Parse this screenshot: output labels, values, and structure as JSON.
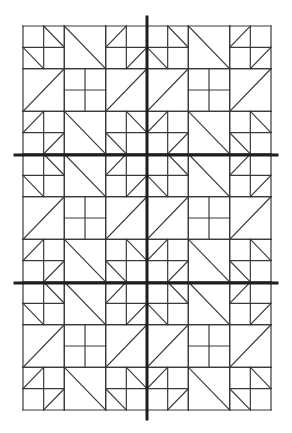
{
  "diagram": {
    "type": "quilt-block-pattern",
    "canvas": {
      "width": 292,
      "height": 433,
      "background": "#ffffff"
    },
    "grid": {
      "left": 23,
      "top": 26,
      "right": 271,
      "bottom": 410,
      "blocks_x": 2,
      "blocks_y": 3,
      "cells_per_block": 6,
      "line_color": "#3a3a3a",
      "line_width": 1.2
    },
    "block": {
      "description": "6x6 cell block: 2x2 units, each unit is a half-square-triangle four-patch, a large diagonal square, or a plain four-patch",
      "units": [
        [
          {
            "kind": "hst4",
            "diagonals": [
              "none",
              "back",
              "back",
              "none"
            ]
          },
          {
            "kind": "big-diagonal",
            "direction": "back"
          },
          {
            "kind": "hst4",
            "diagonals": [
              "fwd",
              "none",
              "none",
              "fwd"
            ]
          }
        ],
        [
          {
            "kind": "big-diagonal",
            "direction": "fwd"
          },
          {
            "kind": "four-patch"
          },
          {
            "kind": "big-diagonal",
            "direction": "fwd"
          }
        ],
        [
          {
            "kind": "hst4",
            "diagonals": [
              "fwd",
              "none",
              "none",
              "fwd"
            ]
          },
          {
            "kind": "big-diagonal",
            "direction": "back"
          },
          {
            "kind": "hst4",
            "diagonals": [
              "none",
              "back",
              "back",
              "none"
            ]
          }
        ]
      ]
    },
    "dividers": {
      "color": "#1e1e1e",
      "width": 3,
      "vertical": [
        {
          "x": 147,
          "y1": 17,
          "y2": 419
        }
      ],
      "horizontal": [
        {
          "y": 155,
          "x1": 15,
          "x2": 277
        },
        {
          "y": 283,
          "x1": 15,
          "x2": 277
        }
      ]
    }
  }
}
